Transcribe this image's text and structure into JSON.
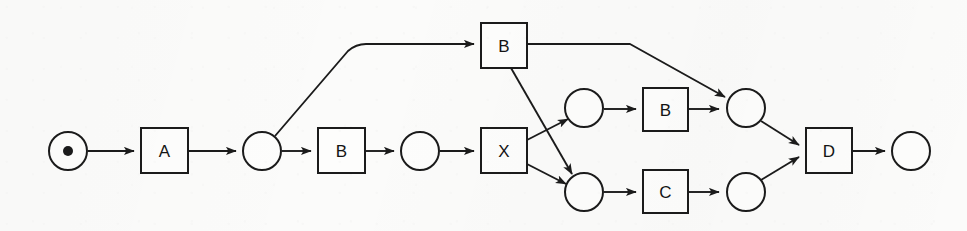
{
  "diagram": {
    "kind": "petri-net",
    "title": "",
    "canvas": {
      "width": 967,
      "height": 231
    },
    "colors": {
      "background": "#fbfbfa",
      "stroke": "#1b1b1b",
      "node_fill": "#fdfdfc",
      "token": "#1b1b1b",
      "label": "#141414"
    },
    "places": [
      {
        "id": "p_start",
        "label": "",
        "cx": 68,
        "cy": 151,
        "r": 19,
        "has_token": true,
        "token_r": 5,
        "name": "start-place"
      },
      {
        "id": "p1",
        "label": "",
        "cx": 262,
        "cy": 151,
        "r": 19,
        "has_token": false,
        "token_r": 0,
        "name": "place-1"
      },
      {
        "id": "p2",
        "label": "",
        "cx": 420,
        "cy": 151,
        "r": 19,
        "has_token": false,
        "token_r": 0,
        "name": "place-2"
      },
      {
        "id": "p3",
        "label": "",
        "cx": 584,
        "cy": 108,
        "r": 19,
        "has_token": false,
        "token_r": 0,
        "name": "place-3-upper"
      },
      {
        "id": "p4",
        "label": "",
        "cx": 584,
        "cy": 192,
        "r": 19,
        "has_token": false,
        "token_r": 0,
        "name": "place-4-lower"
      },
      {
        "id": "p5",
        "label": "",
        "cx": 746,
        "cy": 108,
        "r": 19,
        "has_token": false,
        "token_r": 0,
        "name": "place-5-upper"
      },
      {
        "id": "p6",
        "label": "",
        "cx": 746,
        "cy": 192,
        "r": 19,
        "has_token": false,
        "token_r": 0,
        "name": "place-6-lower"
      },
      {
        "id": "p_end",
        "label": "",
        "cx": 911,
        "cy": 151,
        "r": 19,
        "has_token": false,
        "token_r": 0,
        "name": "end-place"
      }
    ],
    "transitions": [
      {
        "id": "t_a",
        "label": "A",
        "x": 141,
        "y": 128,
        "w": 47,
        "h": 45,
        "name": "transition-a"
      },
      {
        "id": "t_b1",
        "label": "B",
        "x": 318,
        "y": 128,
        "w": 47,
        "h": 45,
        "name": "transition-b-main"
      },
      {
        "id": "t_bt",
        "label": "B",
        "x": 481,
        "y": 23,
        "w": 46,
        "h": 45,
        "name": "transition-b-top"
      },
      {
        "id": "t_x",
        "label": "X",
        "x": 481,
        "y": 128,
        "w": 46,
        "h": 45,
        "name": "transition-x"
      },
      {
        "id": "t_b2",
        "label": "B",
        "x": 643,
        "y": 88,
        "w": 45,
        "h": 43,
        "name": "transition-b-upper"
      },
      {
        "id": "t_c",
        "label": "C",
        "x": 643,
        "y": 170,
        "w": 45,
        "h": 43,
        "name": "transition-c-lower"
      },
      {
        "id": "t_d",
        "label": "D",
        "x": 806,
        "y": 128,
        "w": 46,
        "h": 45,
        "name": "transition-d"
      }
    ],
    "arcs": [
      {
        "id": "a1",
        "from": "p_start",
        "to": "t_a",
        "name": "arc-start-to-a",
        "d": "M 88,151 L 134,151"
      },
      {
        "id": "a2",
        "from": "t_a",
        "to": "p1",
        "name": "arc-a-to-place1",
        "d": "M 188,151 L 236,151"
      },
      {
        "id": "a3",
        "from": "p1",
        "to": "t_b1",
        "name": "arc-place1-to-b",
        "d": "M 282,151 L 311,151"
      },
      {
        "id": "a4",
        "from": "t_b1",
        "to": "p2",
        "name": "arc-b-to-place2",
        "d": "M 365,151 L 394,151"
      },
      {
        "id": "a5",
        "from": "p2",
        "to": "t_x",
        "name": "arc-place2-to-x",
        "d": "M 440,151 L 474,151"
      },
      {
        "id": "a6",
        "from": "p1",
        "to": "t_bt",
        "name": "arc-place1-to-btop",
        "d": "M 275,136 L 348,51 Q 356,44 366,44 L 474,44"
      },
      {
        "id": "a7",
        "from": "t_bt",
        "to": "p5",
        "name": "arc-btop-to-place5",
        "d": "M 527,44 L 630,44 L 725,97"
      },
      {
        "id": "a8",
        "from": "t_bt",
        "to": "p4",
        "name": "arc-btop-to-place4",
        "d": "M 511,68 L 572,174"
      },
      {
        "id": "a9",
        "from": "t_x",
        "to": "p3",
        "name": "arc-x-to-place3",
        "d": "M 527,140 L 568,119"
      },
      {
        "id": "a10",
        "from": "t_x",
        "to": "p4",
        "name": "arc-x-to-place4",
        "d": "M 527,164 L 566,184"
      },
      {
        "id": "a11",
        "from": "p3",
        "to": "t_b2",
        "name": "arc-place3-to-bup",
        "d": "M 604,109 L 636,109"
      },
      {
        "id": "a12",
        "from": "t_b2",
        "to": "p5",
        "name": "arc-bup-to-place5",
        "d": "M 688,109 L 719,109"
      },
      {
        "id": "a13",
        "from": "p4",
        "to": "t_c",
        "name": "arc-place4-to-c",
        "d": "M 604,192 L 636,192"
      },
      {
        "id": "a14",
        "from": "t_c",
        "to": "p6",
        "name": "arc-c-to-place6",
        "d": "M 688,192 L 719,192"
      },
      {
        "id": "a15",
        "from": "p5",
        "to": "t_d",
        "name": "arc-place5-to-d",
        "d": "M 761,121 L 799,145"
      },
      {
        "id": "a16",
        "from": "p6",
        "to": "t_d",
        "name": "arc-place6-to-d",
        "d": "M 761,180 L 799,157"
      },
      {
        "id": "a17",
        "from": "t_d",
        "to": "p_end",
        "name": "arc-d-to-end",
        "d": "M 852,151 L 885,151"
      }
    ]
  }
}
